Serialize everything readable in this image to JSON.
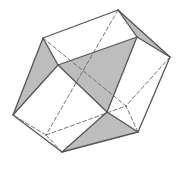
{
  "figure": {
    "colors": {
      "background": "#ffffff",
      "edge": "#555555",
      "hidden_edge": "#666666",
      "shaded_face": "#bdbdbd"
    },
    "vertices": {
      "T": [
        118,
        10
      ],
      "D": [
        170,
        57
      ],
      "H": [
        138,
        132
      ],
      "G": [
        62,
        152
      ],
      "E": [
        13,
        115
      ],
      "A": [
        43,
        38
      ],
      "B": [
        58,
        65
      ],
      "C": [
        137,
        37
      ],
      "F": [
        107,
        112
      ],
      "K": [
        46,
        135
      ],
      "L": [
        126,
        106
      ]
    },
    "shaded_faces": [
      [
        "A",
        "B",
        "E"
      ],
      [
        "B",
        "C",
        "F"
      ],
      [
        "T",
        "C",
        "D"
      ],
      [
        "F",
        "H",
        "G"
      ]
    ],
    "visible_edges": [
      [
        "T",
        "D"
      ],
      [
        "D",
        "H"
      ],
      [
        "H",
        "G"
      ],
      [
        "G",
        "E"
      ],
      [
        "E",
        "A"
      ],
      [
        "A",
        "T"
      ],
      [
        "A",
        "B"
      ],
      [
        "B",
        "E"
      ],
      [
        "B",
        "C"
      ],
      [
        "C",
        "T"
      ],
      [
        "C",
        "D"
      ],
      [
        "C",
        "F"
      ],
      [
        "B",
        "F"
      ],
      [
        "F",
        "H"
      ],
      [
        "F",
        "G"
      ]
    ],
    "hidden_edges": [
      [
        "T",
        "K"
      ],
      [
        "K",
        "E"
      ],
      [
        "K",
        "G"
      ],
      [
        "K",
        "L"
      ],
      [
        "A",
        "L"
      ],
      [
        "D",
        "L"
      ],
      [
        "H",
        "L"
      ]
    ]
  }
}
